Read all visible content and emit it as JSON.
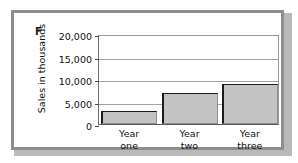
{
  "figure": {
    "panel_letter": "F",
    "frame_color": "#8e8e90",
    "background": "#ffffff"
  },
  "chart_data": {
    "type": "bar",
    "title": "",
    "xlabel": "",
    "ylabel": "Sales in thousands",
    "categories": [
      "Year one",
      "Year two",
      "Year three"
    ],
    "category_lines": [
      [
        "Year",
        "one"
      ],
      [
        "Year",
        "two"
      ],
      [
        "Year",
        "three"
      ]
    ],
    "values": [
      3000,
      7000,
      9000
    ],
    "ylim": [
      0,
      20000
    ],
    "yticks": [
      0,
      5000,
      10000,
      15000,
      20000
    ],
    "ytick_labels": [
      "0",
      "5,000",
      "10,000",
      "15,000",
      "20,000"
    ],
    "grid": true,
    "legend": false,
    "bar_fill_color": "#c3c3c3",
    "bar_edge_color": "#1b1b1b"
  }
}
